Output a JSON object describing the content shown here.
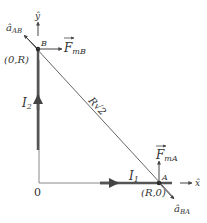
{
  "diagram": {
    "colors": {
      "axis": "#777777",
      "wire": "#555555",
      "diagonal": "#666666",
      "text": "#333333",
      "background": "#ffffff"
    },
    "points": {
      "origin": {
        "label": "0",
        "px": [
          39,
          183
        ]
      },
      "A": {
        "label": "A",
        "coord_label": "(R,0)",
        "px": [
          159,
          183
        ]
      },
      "B": {
        "label": "B",
        "coord_label": "(0,R)",
        "px": [
          38,
          49
        ]
      }
    },
    "axes": {
      "x_label": "x̂",
      "y_label": "ŷ"
    },
    "currents": {
      "I1": {
        "label": "I",
        "sub": "1"
      },
      "I2": {
        "label": "I",
        "sub": "2"
      }
    },
    "distance_label": "R√2",
    "vectors": {
      "F_mB": {
        "label": "F",
        "sub": "mB"
      },
      "F_mA": {
        "label": "F",
        "sub": "mA"
      },
      "a_AB": {
        "label": "â",
        "sub": "AB"
      },
      "a_BA": {
        "label": "â",
        "sub": "BA"
      }
    }
  }
}
